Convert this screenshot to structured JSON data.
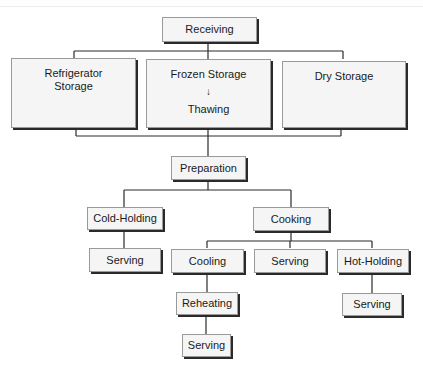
{
  "diagram": {
    "nodes": {
      "receiving": "Receiving",
      "refrigerator_storage": [
        "Refrigerator",
        "Storage"
      ],
      "frozen_storage": "Frozen Storage",
      "thawing": "Thawing",
      "dry_storage": "Dry Storage",
      "preparation": "Preparation",
      "cold_holding": "Cold-Holding",
      "cooking": "Cooking",
      "serving_cold": "Serving",
      "cooling": "Cooling",
      "serving_cooked": "Serving",
      "hot_holding": "Hot-Holding",
      "reheating": "Reheating",
      "serving_reheated": "Serving",
      "serving_hot": "Serving"
    },
    "arrow_icon": "↓",
    "edges": [
      [
        "Receiving",
        "Refrigerator Storage"
      ],
      [
        "Receiving",
        "Frozen Storage"
      ],
      [
        "Receiving",
        "Dry Storage"
      ],
      [
        "Frozen Storage",
        "Thawing"
      ],
      [
        "Refrigerator Storage",
        "Preparation"
      ],
      [
        "Thawing",
        "Preparation"
      ],
      [
        "Dry Storage",
        "Preparation"
      ],
      [
        "Preparation",
        "Cold-Holding"
      ],
      [
        "Preparation",
        "Cooking"
      ],
      [
        "Cold-Holding",
        "Serving"
      ],
      [
        "Cooking",
        "Cooling"
      ],
      [
        "Cooking",
        "Serving"
      ],
      [
        "Cooking",
        "Hot-Holding"
      ],
      [
        "Cooling",
        "Reheating"
      ],
      [
        "Reheating",
        "Serving"
      ],
      [
        "Hot-Holding",
        "Serving"
      ]
    ]
  }
}
